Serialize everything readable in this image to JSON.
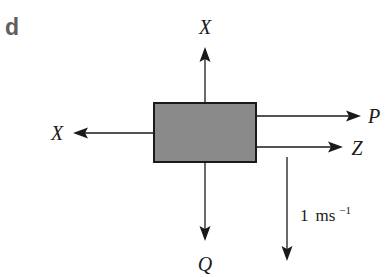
{
  "panel": {
    "label": "d"
  },
  "block": {
    "fill": "#8a8a8a",
    "stroke": "#1a1a1a"
  },
  "forces": {
    "up": {
      "label": "X",
      "direction": "up"
    },
    "left": {
      "label": "X",
      "direction": "left"
    },
    "right_top": {
      "label": "P",
      "direction": "right"
    },
    "right_bottom": {
      "label": "Z",
      "direction": "right"
    },
    "down": {
      "label": "Q",
      "direction": "down"
    }
  },
  "velocity": {
    "value": "1",
    "unit": "ms",
    "exponent": "−1",
    "direction": "down"
  }
}
